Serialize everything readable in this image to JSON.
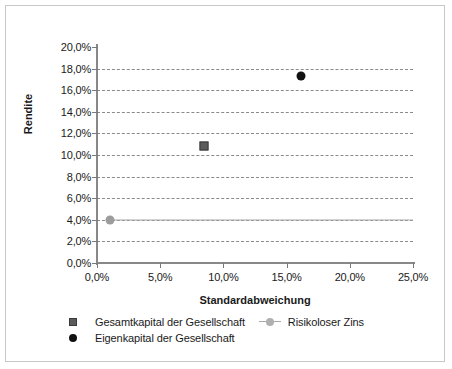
{
  "chart_data": {
    "type": "scatter",
    "title": "",
    "xlabel": "Standardabweichung",
    "ylabel": "Rendite",
    "xlim": [
      0,
      25
    ],
    "ylim": [
      0,
      20
    ],
    "xticks": [
      "0,0%",
      "5,0%",
      "10,0%",
      "15,0%",
      "20,0%",
      "25,0%"
    ],
    "xtick_values": [
      0,
      5,
      10,
      15,
      20,
      25
    ],
    "yticks": [
      "0,0%",
      "2,0%",
      "4,0%",
      "6,0%",
      "8,0%",
      "10,0%",
      "12,0%",
      "14,0%",
      "16,0%",
      "18,0%",
      "20,0%"
    ],
    "ytick_values": [
      0,
      2,
      4,
      6,
      8,
      10,
      12,
      14,
      16,
      18,
      20
    ],
    "grid": "horizontal-dashed",
    "legend_position": "bottom-left",
    "series": [
      {
        "name": "Gesamtkapital der Gesellschaft",
        "marker": "square",
        "color": "#5b5b5b",
        "points": [
          {
            "x": 8.5,
            "y": 10.8
          }
        ]
      },
      {
        "name": "Risikoloser Zins",
        "marker": "circle-line",
        "color": "#9c9c9c",
        "points": [
          {
            "x": 1.0,
            "y": 4.0
          }
        ]
      },
      {
        "name": "Eigenkapital der Gesellschaft",
        "marker": "circle",
        "color": "#121212",
        "points": [
          {
            "x": 16.1,
            "y": 17.3
          }
        ]
      }
    ]
  },
  "axis": {
    "y_title": "Rendite",
    "x_title": "Standardabweichung"
  },
  "legend": {
    "row1": [
      {
        "label": "Gesamtkapital der Gesellschaft",
        "marker": "square-gray"
      },
      {
        "label": "Risikoloser Zins",
        "marker": "line-circle-gray"
      }
    ],
    "row2": [
      {
        "label": "Eigenkapital der Gesellschaft",
        "marker": "circle-black"
      }
    ]
  }
}
